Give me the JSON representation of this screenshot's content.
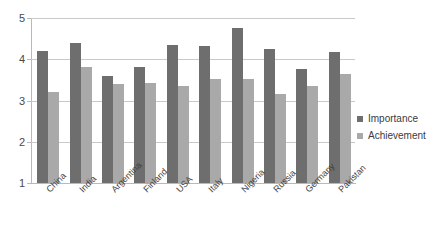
{
  "chart_data": {
    "type": "bar",
    "title": "",
    "subtitle": "",
    "xlabel": "",
    "ylabel": "",
    "ylim": [
      1,
      5
    ],
    "yticks": [
      1,
      2,
      3,
      4,
      5
    ],
    "grid": true,
    "legend_position": "right",
    "categories": [
      "China",
      "India",
      "Argentina",
      "Finland",
      "USA",
      "Italy",
      "Nigeria",
      "Russia",
      "Germany",
      "Pakistan"
    ],
    "series": [
      {
        "name": "Importance",
        "color": "#6e6e6e",
        "values": [
          4.2,
          4.4,
          3.6,
          3.82,
          4.35,
          4.32,
          4.76,
          4.26,
          3.76,
          4.18
        ]
      },
      {
        "name": "Achievement",
        "color": "#a9a9a9",
        "values": [
          3.2,
          3.82,
          3.4,
          3.42,
          3.35,
          3.52,
          3.52,
          3.15,
          3.36,
          3.65
        ]
      }
    ]
  },
  "colors": {
    "importance": "#6e6e6e",
    "achievement": "#a9a9a9",
    "gridline": "#c9c9c9",
    "axis": "#b9b9b9",
    "background": "#ffffff"
  }
}
